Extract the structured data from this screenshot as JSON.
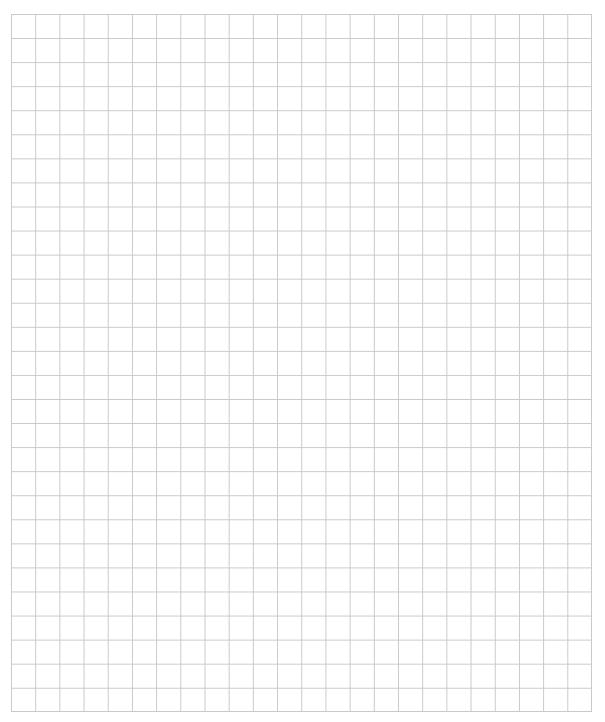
{
  "page": {
    "width": 605,
    "height": 722,
    "background_color": "#ffffff",
    "content_description": "Blank square-ruled grid paper sheet with no text, labels, or interface controls."
  },
  "grid": {
    "name": "square grid paper",
    "origin_x": 11,
    "origin_y": 14,
    "end_x": 592,
    "end_y": 712,
    "width": 581,
    "height": 698,
    "columns": 24,
    "rows": 29,
    "cell_width": 24.2,
    "cell_height": 24.07,
    "line_color": "#c9c9c9",
    "line_width": 1,
    "line_style": "solid",
    "uniform_weight": true,
    "has_major_minor_lines": false,
    "has_axis_labels": false,
    "has_tick_labels": false,
    "has_border_frame": false
  },
  "chart_data": {
    "type": "table",
    "title": "",
    "subtitle": "",
    "xlabel": "",
    "ylabel": "",
    "categories": [],
    "values": [],
    "series": [],
    "annotations": [],
    "legend": [],
    "legend_position": "none",
    "grid": true,
    "xlim": [
      0,
      24
    ],
    "ylim": [
      0,
      29
    ]
  }
}
